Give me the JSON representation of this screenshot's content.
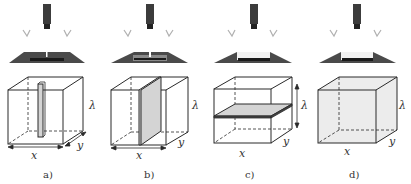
{
  "figure": {
    "colors": {
      "line": "#2a2a2a",
      "camera": "#3c3c3c",
      "light": "#4a4a4a",
      "slice_fill": "#d4d4d4",
      "volume_fill": "#ececec",
      "checkmark": "#b0b0b0"
    },
    "panels": [
      {
        "id": "a",
        "caption": "a)",
        "mode": "line",
        "axis_x": "x",
        "axis_y": "y",
        "axis_lambda": "λ"
      },
      {
        "id": "b",
        "caption": "b)",
        "mode": "plane-vertical",
        "axis_x": "x",
        "axis_y": "y",
        "axis_lambda": "λ"
      },
      {
        "id": "c",
        "caption": "c)",
        "mode": "plane-horizontal",
        "axis_x": "x",
        "axis_y": "y",
        "axis_lambda": "λ"
      },
      {
        "id": "d",
        "caption": "d)",
        "mode": "volume",
        "axis_x": "x",
        "axis_y": "y",
        "axis_lambda": "λ"
      }
    ]
  }
}
